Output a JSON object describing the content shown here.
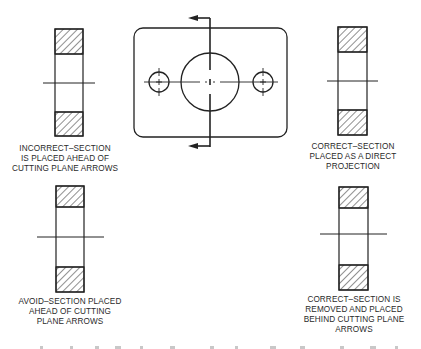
{
  "figure": {
    "colors": {
      "line": "#222222",
      "background": "#ffffff",
      "text": "#2a2a2a"
    },
    "panels": [
      {
        "id": "incorrect-top-left",
        "caption_lines": [
          "INCORRECT–SECTION",
          "IS PLACED AHEAD OF",
          "CUTTING PLANE ARROWS"
        ]
      },
      {
        "id": "correct-top-right",
        "caption_lines": [
          "CORRECT–SECTION",
          "PLACED AS A DIRECT",
          "PROJECTION"
        ]
      },
      {
        "id": "avoid-bottom-left",
        "caption_lines": [
          "AVOID–SECTION PLACED",
          "AHEAD OF CUTTING",
          "PLANE ARROWS"
        ]
      },
      {
        "id": "correct-bottom-right",
        "caption_lines": [
          "CORRECT–SECTION IS",
          "REMOVED AND PLACED",
          "BEHIND CUTTING PLANE",
          "ARROWS"
        ]
      }
    ],
    "center_view": {
      "description": "Plate with central bore and two small holes, vertical cutting plane line with arrows pointing left"
    }
  }
}
